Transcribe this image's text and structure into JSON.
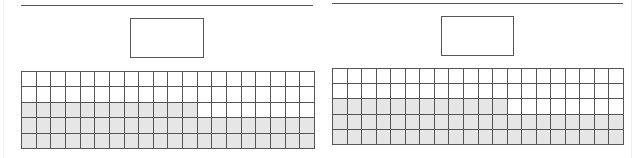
{
  "figure": {
    "colors": {
      "line": "#555555",
      "shade": "#e6e6e6",
      "background": "#ffffff"
    },
    "panels": [
      {
        "id": "left",
        "rule": {
          "x": 21,
          "y": 5,
          "w": 292
        },
        "box": {
          "x": 130,
          "y": 18,
          "w": 74,
          "h": 40
        },
        "grid": {
          "x": 21,
          "y": 71,
          "w": 294,
          "h": 78,
          "columns": 20,
          "rows": 5,
          "shaded_per_row": [
            0,
            0,
            12,
            20,
            20
          ]
        }
      },
      {
        "id": "right",
        "rule": {
          "x": 332,
          "y": 3,
          "w": 291
        },
        "box": {
          "x": 441,
          "y": 16,
          "w": 73,
          "h": 40
        },
        "grid": {
          "x": 332,
          "y": 68,
          "w": 292,
          "h": 77,
          "columns": 20,
          "rows": 5,
          "shaded_per_row": [
            0,
            0,
            12,
            20,
            20
          ]
        }
      }
    ]
  }
}
